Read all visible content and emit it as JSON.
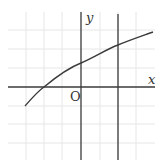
{
  "diagram": {
    "type": "function-graph",
    "labels": {
      "x_axis": "x",
      "y_axis": "y",
      "origin": "O"
    },
    "grid": {
      "visible": true,
      "vertical_lines_px": [
        26,
        44,
        62,
        100,
        118,
        136
      ],
      "horizontal_lines_px": [
        30,
        49,
        68,
        106,
        124,
        143
      ],
      "color": "#e6e6e6"
    },
    "axes": {
      "origin_px": [
        81,
        87
      ],
      "x_axis": {
        "x1": 8,
        "x2": 155,
        "y": 87
      },
      "y_axis": {
        "x": 81,
        "y1": 12,
        "y2": 160
      }
    },
    "vertical_line": {
      "x": 118,
      "y1": 14,
      "y2": 160,
      "grid_units_from_origin": 2
    },
    "curve": {
      "shape": "logarithmic-like increasing curve",
      "path": "M25,106 C32,98 38,91 44,87 C56,77 68,68 81,63 C95,57 107,49 118,45 C130,40 142,36 153,32",
      "x_intercept_grid_units": -2,
      "y_intercept_grid_units": 1.3
    },
    "colors": {
      "line": "#3a3a3a",
      "grid": "#e6e6e6",
      "background": "#ffffff"
    }
  }
}
